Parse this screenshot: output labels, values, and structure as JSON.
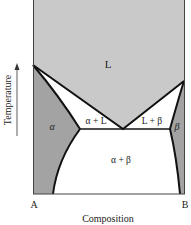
{
  "diagram": {
    "type": "binary eutectic phase diagram",
    "axes": {
      "x_label": "Composition",
      "y_label": "Temperature",
      "x_left_end": "A",
      "x_right_end": "B"
    },
    "regions": {
      "liquid": "L",
      "alpha": "α",
      "beta": "β",
      "alpha_plus_liquid": "α + L",
      "liquid_plus_beta": "L + β",
      "alpha_plus_beta": "α + β"
    },
    "colors": {
      "liquid": "#c9c9c9",
      "solid_solution": "#a3a3a3",
      "two_phase": "#ffffff",
      "lines": "#111111"
    }
  }
}
